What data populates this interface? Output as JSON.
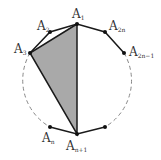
{
  "diagram": {
    "type": "regular polygon inscribed in circle",
    "shaded_region": "triangle A1 A3 An+1",
    "colors": {
      "stroke": "#1a1a1a",
      "shade": "#a9a9a9",
      "dash": "#888888",
      "text": "#333333"
    },
    "vertices": [
      {
        "id": "A1",
        "main": "A",
        "sub": "1"
      },
      {
        "id": "A2",
        "main": "A",
        "sub": "2"
      },
      {
        "id": "A3",
        "main": "A",
        "sub": "3"
      },
      {
        "id": "A2n",
        "main": "A",
        "sub": "2n"
      },
      {
        "id": "A2n-1",
        "main": "A",
        "sub": "2n−1"
      },
      {
        "id": "An",
        "main": "A",
        "sub": "n"
      },
      {
        "id": "An+1",
        "main": "A",
        "sub": "n+1"
      }
    ]
  }
}
